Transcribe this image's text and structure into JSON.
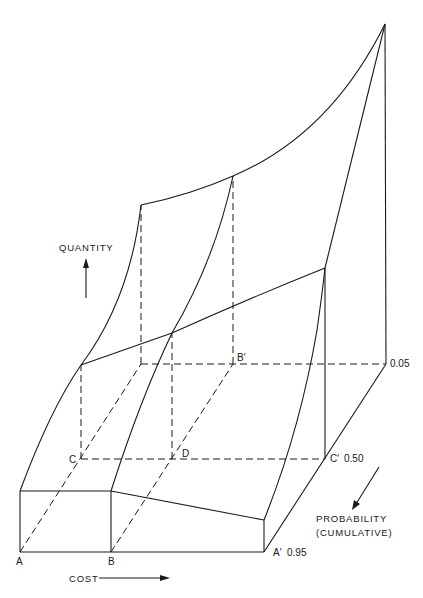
{
  "diagram": {
    "type": "3d-surface-line-drawing",
    "axes": {
      "quantity": "QUANTITY",
      "cost": "COST",
      "probability_line1": "PROBABILITY",
      "probability_line2": "(CUMULATIVE)"
    },
    "points": {
      "A": "A",
      "B": "B",
      "A_prime": "A′",
      "C": "C",
      "D": "D",
      "C_prime": "C′",
      "B_prime": "B′"
    },
    "probability_levels": {
      "p95": "0.95",
      "p50": "0.50",
      "p05": "0.05"
    },
    "colors": {
      "line": "#1a1a1a",
      "background": "#ffffff"
    }
  }
}
